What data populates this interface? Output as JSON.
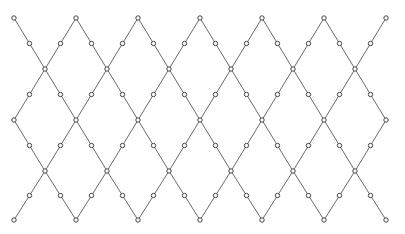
{
  "diagram": {
    "type": "diamond-lattice",
    "width": 405,
    "height": 234,
    "colors": {
      "edge": "#6a6a6a",
      "node_stroke": "#444444",
      "node_fill": "#ffffff",
      "background": "#ffffff"
    },
    "node_radius": 2.2,
    "columns_x": [
      14,
      76,
      138,
      200,
      262,
      324,
      386
    ],
    "rows_y": [
      18,
      69,
      120,
      171,
      220
    ]
  }
}
